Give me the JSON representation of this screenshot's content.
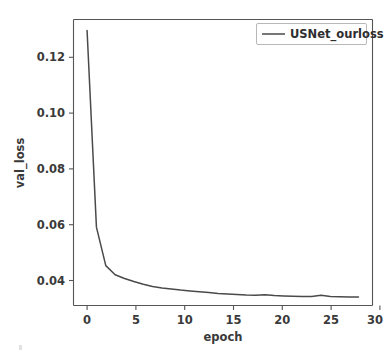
{
  "chart_data": {
    "type": "line",
    "title": "",
    "xlabel": "epoch",
    "ylabel": "val_loss",
    "xlim": [
      -1.45,
      30.5
    ],
    "ylim": [
      0.0325,
      0.1365
    ],
    "grid": false,
    "legend_position": "upper right",
    "xticks": [
      0,
      5,
      10,
      15,
      20,
      25,
      30
    ],
    "xtick_labels": [
      "0",
      "5",
      "10",
      "15",
      "20",
      "25",
      "30"
    ],
    "yticks": [
      0.04,
      0.06,
      0.08,
      0.1,
      0.12
    ],
    "ytick_labels": [
      "0.04",
      "0.06",
      "0.08",
      "0.10",
      "0.12"
    ],
    "line_color": "#4a4a4a",
    "axis_color": "#555555",
    "text_color": "#3a3a3a",
    "background_color": "#ffffff",
    "series": [
      {
        "name": "USNet_ourloss",
        "x": [
          0,
          1,
          2,
          3,
          4,
          5,
          6,
          7,
          8,
          9,
          10,
          11,
          12,
          13,
          14,
          15,
          16,
          17,
          18,
          19,
          20,
          21,
          22,
          23,
          24,
          25,
          26,
          27,
          28,
          29
        ],
        "values": [
          0.1325,
          0.061,
          0.047,
          0.0437,
          0.0423,
          0.0412,
          0.0402,
          0.0394,
          0.0389,
          0.0385,
          0.0381,
          0.0378,
          0.0375,
          0.0372,
          0.0369,
          0.0367,
          0.0365,
          0.0363,
          0.0362,
          0.0364,
          0.0361,
          0.036,
          0.0359,
          0.0358,
          0.0358,
          0.0362,
          0.0358,
          0.0357,
          0.0356,
          0.0356
        ]
      }
    ]
  },
  "legend": {
    "entries": [
      {
        "label": "USNet_ourloss"
      }
    ]
  },
  "axes": {
    "x_title": "epoch",
    "y_title": "val_loss"
  }
}
